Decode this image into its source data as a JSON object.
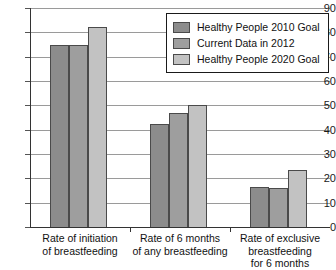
{
  "chart_data": {
    "type": "bar",
    "title": "",
    "xlabel": "",
    "ylabel": "",
    "ylim": [
      0,
      90
    ],
    "ytick_step": 10,
    "yticks": [
      0,
      10,
      20,
      30,
      40,
      50,
      60,
      70,
      80,
      90
    ],
    "grid": true,
    "legend_position": "top-right",
    "categories": [
      "Rate of initiation\nof breastfeeding",
      "Rate of 6 months\nof any breastfeeding",
      "Rate of exclusive\nbreastfeeding\nfor 6 months"
    ],
    "category_lines": [
      [
        "Rate of initiation",
        "of breastfeeding"
      ],
      [
        "Rate of 6 months",
        "of any breastfeeding"
      ],
      [
        "Rate of exclusive",
        "breastfeeding",
        "for 6 months"
      ]
    ],
    "series": [
      {
        "name": "Healthy People 2010 Goal",
        "color": "#8c8c8c",
        "values": [
          75,
          42.5,
          16.5
        ]
      },
      {
        "name": "Current Data in 2012",
        "color": "#9e9e9e",
        "values": [
          75,
          47,
          16
        ]
      },
      {
        "name": "Healthy People 2020 Goal",
        "color": "#c2c2c2",
        "values": [
          82,
          50,
          23.5
        ]
      }
    ]
  },
  "legend": {
    "items": [
      {
        "label": "Healthy People 2010 Goal",
        "color": "#8c8c8c"
      },
      {
        "label": "Current Data in 2012",
        "color": "#9e9e9e"
      },
      {
        "label": "Healthy People 2020 Goal",
        "color": "#c2c2c2"
      }
    ]
  },
  "axis": {
    "y_tick_labels": [
      "90",
      "80",
      "70",
      "60",
      "50",
      "40",
      "30",
      "20",
      "10",
      "0"
    ]
  }
}
